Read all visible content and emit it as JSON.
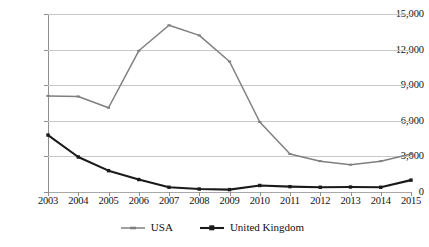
{
  "chart_data": {
    "type": "line",
    "title": "",
    "xlabel": "",
    "ylabel": "",
    "categories": [
      "2003",
      "2004",
      "2005",
      "2006",
      "2007",
      "2008",
      "2009",
      "2010",
      "2011",
      "2012",
      "2013",
      "2014",
      "2015"
    ],
    "x": [
      2003,
      2004,
      2005,
      2006,
      2007,
      2008,
      2009,
      2010,
      2011,
      2012,
      2013,
      2014,
      2015
    ],
    "ylim": [
      0,
      15000
    ],
    "ytick_values": [
      0,
      3000,
      6000,
      9000,
      12000,
      15000
    ],
    "ytick_labels": [
      "0",
      "3,000",
      "6,000",
      "9,000",
      "12,000",
      "15,000"
    ],
    "grid": true,
    "legend_position": "bottom",
    "series": [
      {
        "name": "USA",
        "color": "#7f7f7f",
        "marker": "dash",
        "values": [
          8100,
          8050,
          7100,
          11900,
          14050,
          13200,
          11000,
          5900,
          3200,
          2600,
          2300,
          2600,
          3200
        ]
      },
      {
        "name": "United Kingdom",
        "color": "#1a1a1a",
        "marker": "square",
        "values": [
          4800,
          2950,
          1800,
          1050,
          400,
          250,
          200,
          550,
          450,
          400,
          420,
          400,
          1000
        ]
      }
    ]
  },
  "legend": {
    "entries": [
      {
        "label": "USA"
      },
      {
        "label": "United Kingdom"
      }
    ]
  }
}
